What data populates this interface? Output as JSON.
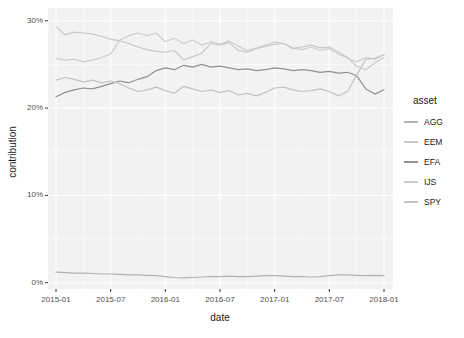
{
  "figure": {
    "background": "#ffffff",
    "panel_background": "#f2f2f2",
    "grid_major_color": "#ffffff",
    "grid_minor_color": "#fafafa",
    "tick_mark_color": "#333333",
    "tick_label_color": "#4d4d4d",
    "y_axis": {
      "title": "contribution",
      "ticks": [
        {
          "label": "0%",
          "value": 0
        },
        {
          "label": "10%",
          "value": 10
        },
        {
          "label": "20%",
          "value": 20
        },
        {
          "label": "30%",
          "value": 30
        }
      ]
    },
    "x_axis": {
      "title": "date",
      "ticks": [
        {
          "label": "2015-01",
          "index": 0
        },
        {
          "label": "2015-07",
          "index": 6
        },
        {
          "label": "2016-01",
          "index": 12
        },
        {
          "label": "2016-07",
          "index": 18
        },
        {
          "label": "2017-01",
          "index": 24
        },
        {
          "label": "2017-07",
          "index": 30
        },
        {
          "label": "2018-01",
          "index": 36
        }
      ]
    },
    "legend": {
      "title": "asset",
      "position": "right"
    }
  },
  "chart_data": {
    "type": "line",
    "title": "",
    "xlabel": "date",
    "ylabel": "contribution",
    "ylim": [
      0,
      30
    ],
    "grid": true,
    "legend_position": "right",
    "x": [
      "2015-01",
      "2015-02",
      "2015-03",
      "2015-04",
      "2015-05",
      "2015-06",
      "2015-07",
      "2015-08",
      "2015-09",
      "2015-10",
      "2015-11",
      "2015-12",
      "2016-01",
      "2016-02",
      "2016-03",
      "2016-04",
      "2016-05",
      "2016-06",
      "2016-07",
      "2016-08",
      "2016-09",
      "2016-10",
      "2016-11",
      "2016-12",
      "2017-01",
      "2017-02",
      "2017-03",
      "2017-04",
      "2017-05",
      "2017-06",
      "2017-07",
      "2017-08",
      "2017-09",
      "2017-10",
      "2017-11",
      "2017-12",
      "2018-01"
    ],
    "y_unit": "percent",
    "series": [
      {
        "name": "AGG",
        "color": "#b2b2b0",
        "values": [
          1.2,
          1.15,
          1.1,
          1.1,
          1.05,
          1.0,
          1.0,
          0.95,
          0.9,
          0.9,
          0.85,
          0.8,
          0.7,
          0.6,
          0.55,
          0.6,
          0.65,
          0.7,
          0.7,
          0.75,
          0.7,
          0.7,
          0.75,
          0.8,
          0.8,
          0.75,
          0.7,
          0.7,
          0.65,
          0.7,
          0.8,
          0.9,
          0.9,
          0.85,
          0.8,
          0.85,
          0.8
        ]
      },
      {
        "name": "EEM",
        "color": "#c8cac6",
        "values": [
          29.3,
          28.4,
          28.7,
          28.6,
          28.5,
          28.2,
          27.9,
          27.7,
          27.4,
          27.0,
          26.7,
          26.5,
          26.4,
          26.6,
          25.5,
          25.9,
          26.3,
          27.4,
          27.2,
          27.5,
          26.6,
          26.4,
          26.8,
          27.1,
          27.3,
          27.4,
          26.8,
          27.0,
          27.2,
          26.9,
          27.0,
          26.4,
          25.8,
          24.8,
          24.4,
          25.2,
          25.8
        ]
      },
      {
        "name": "EFA",
        "color": "#909290",
        "values": [
          21.3,
          21.8,
          22.1,
          22.3,
          22.2,
          22.5,
          22.8,
          23.1,
          22.9,
          23.3,
          23.6,
          24.3,
          24.6,
          24.4,
          24.9,
          24.7,
          25.0,
          24.7,
          24.8,
          24.6,
          24.4,
          24.5,
          24.3,
          24.4,
          24.6,
          24.5,
          24.3,
          24.4,
          24.3,
          24.1,
          24.2,
          24.0,
          24.1,
          23.7,
          22.2,
          21.6,
          22.1
        ]
      },
      {
        "name": "IJS",
        "color": "#cccec9",
        "values": [
          25.7,
          25.5,
          25.6,
          25.3,
          25.5,
          25.8,
          26.2,
          27.8,
          28.3,
          28.6,
          28.3,
          28.6,
          27.6,
          28.0,
          27.4,
          27.8,
          27.2,
          27.6,
          27.3,
          27.7,
          27.1,
          26.6,
          26.9,
          27.2,
          27.6,
          27.4,
          26.9,
          26.7,
          27.0,
          26.6,
          26.8,
          26.2,
          25.7,
          25.3,
          25.8,
          25.6,
          26.1
        ]
      },
      {
        "name": "SPY",
        "color": "#c3c5c1",
        "values": [
          23.2,
          23.5,
          23.3,
          23.0,
          23.2,
          22.9,
          23.1,
          22.8,
          22.3,
          21.9,
          22.1,
          22.4,
          22.0,
          21.7,
          22.5,
          22.2,
          21.9,
          22.1,
          21.8,
          22.0,
          21.5,
          21.7,
          21.4,
          21.8,
          22.3,
          22.4,
          22.1,
          21.9,
          22.0,
          22.2,
          21.9,
          21.4,
          21.9,
          23.8,
          25.6,
          25.7,
          26.1
        ]
      }
    ]
  }
}
